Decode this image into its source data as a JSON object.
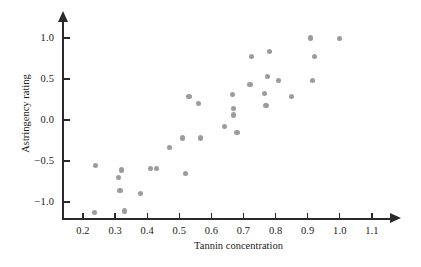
{
  "chart_data": {
    "type": "scatter",
    "title": "",
    "xlabel": "Tannin concentration",
    "ylabel": "Astringency rating",
    "xlim": [
      0.155,
      1.18
    ],
    "ylim": [
      -1.32,
      1.12
    ],
    "grid": false,
    "legend": null,
    "xticks": [
      "0.2",
      "0.3",
      "0.4",
      "0.5",
      "0.6",
      "0.7",
      "0.8",
      "0.9",
      "1.0",
      "1.1"
    ],
    "xtick_values": [
      0.2,
      0.3,
      0.4,
      0.5,
      0.6,
      0.7,
      0.8,
      0.9,
      1.0,
      1.1
    ],
    "yticks": [
      "1.0",
      "0.5",
      "0.0",
      "−0.5",
      "−1.0"
    ],
    "ytick_values": [
      1.0,
      0.5,
      0.0,
      -0.5,
      -1.0
    ],
    "marker_color": "#9c9c9c",
    "axis_color": "#2a2a2a",
    "points": [
      {
        "x": 0.235,
        "y": -1.13
      },
      {
        "x": 0.24,
        "y": -0.55
      },
      {
        "x": 0.31,
        "y": -0.7
      },
      {
        "x": 0.315,
        "y": -0.86
      },
      {
        "x": 0.32,
        "y": -0.61
      },
      {
        "x": 0.33,
        "y": -1.11
      },
      {
        "x": 0.38,
        "y": -0.9
      },
      {
        "x": 0.41,
        "y": -0.59
      },
      {
        "x": 0.43,
        "y": -0.59
      },
      {
        "x": 0.47,
        "y": -0.34
      },
      {
        "x": 0.51,
        "y": -0.22
      },
      {
        "x": 0.52,
        "y": -0.65
      },
      {
        "x": 0.53,
        "y": 0.29
      },
      {
        "x": 0.56,
        "y": 0.2
      },
      {
        "x": 0.565,
        "y": -0.22
      },
      {
        "x": 0.64,
        "y": -0.08
      },
      {
        "x": 0.665,
        "y": 0.31
      },
      {
        "x": 0.67,
        "y": 0.14
      },
      {
        "x": 0.67,
        "y": 0.06
      },
      {
        "x": 0.68,
        "y": -0.15
      },
      {
        "x": 0.72,
        "y": 0.43
      },
      {
        "x": 0.725,
        "y": 0.77
      },
      {
        "x": 0.765,
        "y": 0.32
      },
      {
        "x": 0.77,
        "y": 0.18
      },
      {
        "x": 0.775,
        "y": 0.53
      },
      {
        "x": 0.78,
        "y": 0.84
      },
      {
        "x": 0.81,
        "y": 0.48
      },
      {
        "x": 0.85,
        "y": 0.29
      },
      {
        "x": 0.91,
        "y": 1.0
      },
      {
        "x": 0.915,
        "y": 0.48
      },
      {
        "x": 0.92,
        "y": 0.77
      },
      {
        "x": 1.0,
        "y": 0.99
      }
    ]
  },
  "figure": {
    "background_color": "#ffffff"
  }
}
